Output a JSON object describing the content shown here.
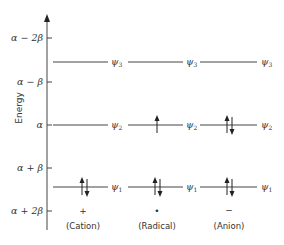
{
  "diagram": {
    "axis": {
      "title": "Energy",
      "direction": "up"
    },
    "energy_levels": [
      {
        "label": "α − 2β",
        "y": 38
      },
      {
        "label": "α − β",
        "y": 82
      },
      {
        "label": "α",
        "y": 125
      },
      {
        "label": "α + β",
        "y": 168
      },
      {
        "label": "α + 2β",
        "y": 211
      }
    ],
    "orbitals": [
      {
        "name": "ψ",
        "sub": "3",
        "y": 62
      },
      {
        "name": "ψ",
        "sub": "2",
        "y": 125
      },
      {
        "name": "ψ",
        "sub": "1",
        "y": 187
      }
    ],
    "species": [
      {
        "name": "(Cation)",
        "charge": "+",
        "occupancy": {
          "psi1": "paired",
          "psi2": "empty",
          "psi3": "empty"
        }
      },
      {
        "name": "(Radical)",
        "charge": "•",
        "occupancy": {
          "psi1": "paired",
          "psi2": "up",
          "psi3": "empty"
        }
      },
      {
        "name": "(Anion)",
        "charge": "−",
        "occupancy": {
          "psi1": "paired",
          "psi2": "paired",
          "psi3": "empty"
        }
      }
    ]
  }
}
